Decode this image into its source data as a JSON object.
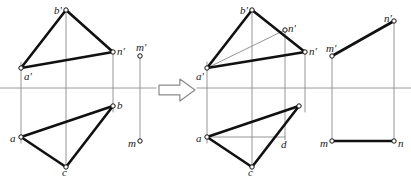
{
  "diagram": {
    "colors": {
      "ink": "#111111",
      "thin": "#8a8a8a",
      "axis": "#9a9a9a",
      "marker_fill": "#ffffff",
      "background": "#ffffff"
    },
    "ground_line_y": 88,
    "arrow": {
      "name": "transform-arrow",
      "glyph": "right-arrow",
      "x": 159,
      "y": 79,
      "width": 36,
      "height": 22
    },
    "left_view": {
      "name": "before-view",
      "points": [
        {
          "id": "a_f",
          "label": "a'",
          "x": 21,
          "y": 68,
          "lx": 24,
          "ly": 71,
          "marker": "open"
        },
        {
          "id": "b_f",
          "label": "b'",
          "x": 66,
          "y": 10,
          "lx": 54,
          "ly": 5,
          "marker": "open"
        },
        {
          "id": "n_f",
          "label": "n'",
          "x": 113,
          "y": 52,
          "lx": 117,
          "ly": 46,
          "marker": "open"
        },
        {
          "id": "m_f",
          "label": "m'",
          "x": 140,
          "y": 56,
          "lx": 136,
          "ly": 42,
          "marker": "open"
        },
        {
          "id": "a_h",
          "label": "a",
          "x": 21,
          "y": 137,
          "lx": 10,
          "ly": 133,
          "marker": "open"
        },
        {
          "id": "b_h",
          "label": "b",
          "x": 113,
          "y": 106,
          "lx": 117,
          "ly": 100,
          "marker": "open"
        },
        {
          "id": "c_h",
          "label": "c",
          "x": 66,
          "y": 167,
          "lx": 62,
          "ly": 167,
          "marker": "open"
        },
        {
          "id": "m_h",
          "label": "m",
          "x": 140,
          "y": 141,
          "lx": 128,
          "ly": 138,
          "marker": "open"
        }
      ],
      "thick_lines": [
        {
          "name": "edge-a-b-frontal",
          "x1": 21,
          "y1": 68,
          "x2": 66,
          "y2": 10
        },
        {
          "name": "edge-b-n-frontal",
          "x1": 66,
          "y1": 10,
          "x2": 113,
          "y2": 52
        },
        {
          "name": "edge-a-n-frontal",
          "x1": 21,
          "y1": 68,
          "x2": 113,
          "y2": 52
        },
        {
          "name": "edge-a-b-horizontal",
          "x1": 21,
          "y1": 137,
          "x2": 113,
          "y2": 106
        },
        {
          "name": "edge-b-c-horizontal",
          "x1": 113,
          "y1": 106,
          "x2": 66,
          "y2": 167
        },
        {
          "name": "edge-a-c-horizontal",
          "x1": 21,
          "y1": 137,
          "x2": 66,
          "y2": 167
        }
      ],
      "thin_lines": [
        {
          "name": "projector-a",
          "x1": 21,
          "y1": 62,
          "x2": 21,
          "y2": 143
        },
        {
          "name": "projector-b",
          "x1": 66,
          "y1": 12,
          "x2": 66,
          "y2": 167
        },
        {
          "name": "projector-n",
          "x1": 113,
          "y1": 52,
          "x2": 113,
          "y2": 112
        },
        {
          "name": "projector-m",
          "x1": 140,
          "y1": 56,
          "x2": 140,
          "y2": 141
        }
      ],
      "axis": {
        "name": "ground-line-left",
        "x1": 0,
        "y1": 88,
        "x2": 156,
        "y2": 88
      }
    },
    "right_view": {
      "name": "after-view",
      "points": [
        {
          "id": "a_f2",
          "label": "a'",
          "x": 207,
          "y": 68,
          "lx": 196,
          "ly": 71,
          "marker": "open"
        },
        {
          "id": "b_f2",
          "label": "b'",
          "x": 252,
          "y": 10,
          "lx": 240,
          "ly": 5,
          "marker": "open"
        },
        {
          "id": "n1_f2",
          "label": "n'",
          "x": 285,
          "y": 30,
          "lx": 288,
          "ly": 23,
          "marker": "open"
        },
        {
          "id": "n2_f2",
          "label": "n'",
          "x": 305,
          "y": 52,
          "lx": 309,
          "ly": 46,
          "marker": "open"
        },
        {
          "id": "m_f2",
          "label": "m'",
          "x": 332,
          "y": 56,
          "lx": 326,
          "ly": 43,
          "marker": "open"
        },
        {
          "id": "nr_f2",
          "label": "n'",
          "x": 394,
          "y": 21,
          "lx": 384,
          "ly": 13,
          "marker": "open"
        },
        {
          "id": "a_h2",
          "label": "a",
          "x": 207,
          "y": 137,
          "lx": 196,
          "ly": 133,
          "marker": "open"
        },
        {
          "id": "b_h2",
          "label": "",
          "x": 299,
          "y": 106,
          "lx": 0,
          "ly": 0,
          "marker": "open"
        },
        {
          "id": "c_h2",
          "label": "c",
          "x": 252,
          "y": 167,
          "lx": 248,
          "ly": 167,
          "marker": "open"
        },
        {
          "id": "d_h2",
          "label": "d",
          "x": 280,
          "y": 137,
          "lx": 281,
          "ly": 139,
          "marker": "none"
        },
        {
          "id": "m_h2",
          "label": "m",
          "x": 332,
          "y": 141,
          "lx": 320,
          "ly": 138,
          "marker": "open"
        },
        {
          "id": "n_h2",
          "label": "n",
          "x": 394,
          "y": 141,
          "lx": 398,
          "ly": 138,
          "marker": "open"
        }
      ],
      "thick_lines": [
        {
          "name": "edge-a-b-frontal-2",
          "x1": 207,
          "y1": 68,
          "x2": 252,
          "y2": 10
        },
        {
          "name": "edge-b-n-frontal-2",
          "x1": 252,
          "y1": 10,
          "x2": 305,
          "y2": 52
        },
        {
          "name": "edge-a-n-frontal-2",
          "x1": 207,
          "y1": 68,
          "x2": 305,
          "y2": 52
        },
        {
          "name": "edge-a-b-horizontal-2",
          "x1": 207,
          "y1": 137,
          "x2": 299,
          "y2": 106
        },
        {
          "name": "edge-b-c-horizontal-2",
          "x1": 299,
          "y1": 106,
          "x2": 252,
          "y2": 167
        },
        {
          "name": "edge-a-c-horizontal-2",
          "x1": 207,
          "y1": 137,
          "x2": 252,
          "y2": 167
        },
        {
          "name": "line-mn-frontal",
          "x1": 332,
          "y1": 56,
          "x2": 394,
          "y2": 21
        },
        {
          "name": "line-mn-horizontal",
          "x1": 332,
          "y1": 141,
          "x2": 394,
          "y2": 141
        }
      ],
      "thin_lines": [
        {
          "name": "construction-a-n1",
          "x1": 207,
          "y1": 68,
          "x2": 285,
          "y2": 30
        },
        {
          "name": "construction-a-d",
          "x1": 207,
          "y1": 137,
          "x2": 285,
          "y2": 137
        },
        {
          "name": "projector-a-2",
          "x1": 207,
          "y1": 62,
          "x2": 207,
          "y2": 143
        },
        {
          "name": "projector-b-2",
          "x1": 252,
          "y1": 12,
          "x2": 252,
          "y2": 167
        },
        {
          "name": "projector-n1-2",
          "x1": 285,
          "y1": 30,
          "x2": 285,
          "y2": 140
        },
        {
          "name": "projector-n2-2",
          "x1": 305,
          "y1": 52,
          "x2": 305,
          "y2": 112
        },
        {
          "name": "projector-m-2",
          "x1": 332,
          "y1": 56,
          "x2": 332,
          "y2": 141
        },
        {
          "name": "projector-n-right",
          "x1": 394,
          "y1": 21,
          "x2": 394,
          "y2": 141
        }
      ],
      "axis": {
        "name": "ground-line-right",
        "x1": 197,
        "y1": 88,
        "x2": 411,
        "y2": 88
      }
    }
  }
}
